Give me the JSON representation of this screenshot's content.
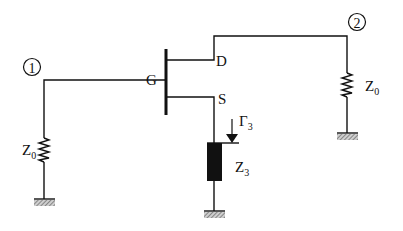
{
  "diagram": {
    "type": "circuit-schematic",
    "ports": [
      {
        "id": "port-1",
        "label": "1"
      },
      {
        "id": "port-2",
        "label": "2"
      }
    ],
    "transistor": {
      "gate_label": "G",
      "drain_label": "D",
      "source_label": "S"
    },
    "components": {
      "left_load": {
        "label": "Z",
        "subscript": "0"
      },
      "right_load": {
        "label": "Z",
        "subscript": "0"
      },
      "source_load": {
        "label": "Z",
        "subscript": "3"
      },
      "reflection": {
        "label": "Γ",
        "subscript": "3"
      }
    },
    "colors": {
      "line": "#111111",
      "ground_hatch": "#555555",
      "background": "#ffffff"
    }
  }
}
